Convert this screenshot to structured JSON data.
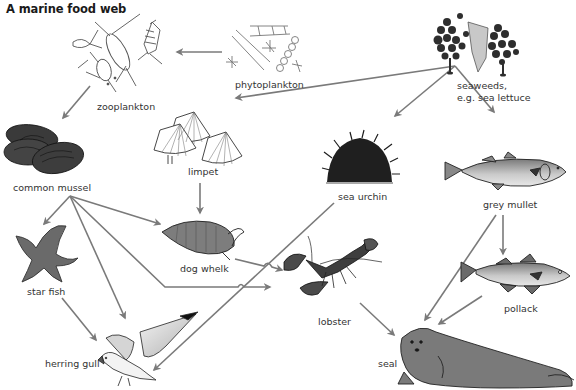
{
  "title": "A marine food web",
  "organisms": [
    {
      "id": "phytoplankton",
      "label": "phytoplankton"
    },
    {
      "id": "zooplankton",
      "label": "zooplankton"
    },
    {
      "id": "seaweeds",
      "label": "seaweeds,",
      "label2": "e.g. sea lettuce"
    },
    {
      "id": "common_mussel",
      "label": "common mussel"
    },
    {
      "id": "limpet",
      "label": "limpet"
    },
    {
      "id": "sea_urchin",
      "label": "sea urchin"
    },
    {
      "id": "grey_mullet",
      "label": "grey mullet"
    },
    {
      "id": "star_fish",
      "label": "star fish"
    },
    {
      "id": "dog_whelk",
      "label": "dog whelk"
    },
    {
      "id": "lobster",
      "label": "lobster"
    },
    {
      "id": "pollack",
      "label": "pollack"
    },
    {
      "id": "herring_gull",
      "label": "herring gull"
    },
    {
      "id": "seal",
      "label": "seal"
    }
  ],
  "links": [
    {
      "from": "phytoplankton",
      "to": "zooplankton"
    },
    {
      "from": "zooplankton",
      "to": "common_mussel"
    },
    {
      "from": "seaweeds",
      "to": "limpet"
    },
    {
      "from": "seaweeds",
      "to": "sea_urchin"
    },
    {
      "from": "seaweeds",
      "to": "grey_mullet"
    },
    {
      "from": "limpet",
      "to": "dog_whelk"
    },
    {
      "from": "common_mussel",
      "to": "star_fish"
    },
    {
      "from": "common_mussel",
      "to": "dog_whelk"
    },
    {
      "from": "common_mussel",
      "to": "herring_gull"
    },
    {
      "from": "common_mussel",
      "to": "lobster"
    },
    {
      "from": "dog_whelk",
      "to": "lobster"
    },
    {
      "from": "sea_urchin",
      "to": "herring_gull"
    },
    {
      "from": "star_fish",
      "to": "herring_gull"
    },
    {
      "from": "lobster",
      "to": "seal"
    },
    {
      "from": "grey_mullet",
      "to": "pollack"
    },
    {
      "from": "grey_mullet",
      "to": "seal"
    },
    {
      "from": "pollack",
      "to": "seal"
    }
  ],
  "colors": {
    "arrow": "#7a7a7a",
    "dark_fill": "#3a3a3a",
    "mid_fill": "#7b7b7b",
    "light_fill": "#bdbdbd",
    "outline": "#222222"
  }
}
